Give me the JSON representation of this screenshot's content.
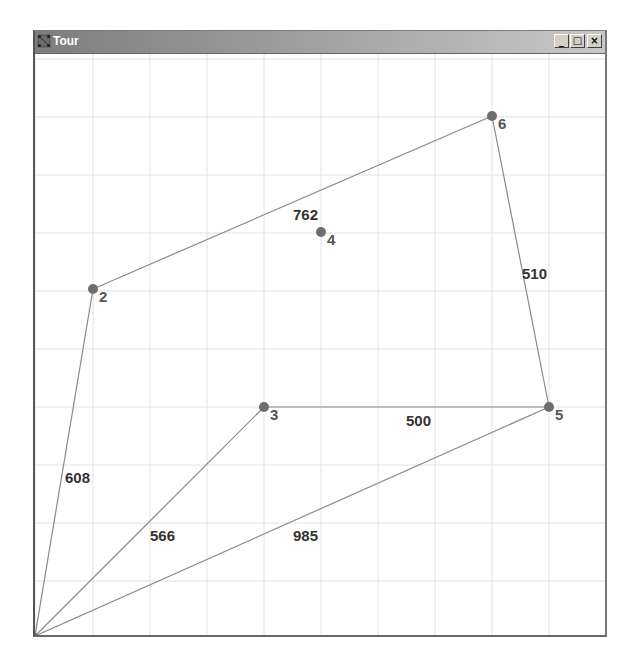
{
  "window": {
    "title": "Tour",
    "icon": "graph-app-icon",
    "controls": {
      "minimize": "_",
      "maximize": "□",
      "close": "×"
    }
  },
  "grid": {
    "columns_x": [
      35,
      93,
      150,
      207,
      264,
      321,
      378,
      435,
      492,
      549,
      606
    ],
    "rows_y": [
      58,
      116,
      174,
      232,
      290,
      348,
      406,
      464,
      522,
      580
    ],
    "color": "#e2e2e2"
  },
  "colors": {
    "node": "#6e6e6e",
    "edge": "#8a8a8a",
    "grid": "#e2e2e2",
    "label": "#555555"
  },
  "nodes": [
    {
      "id": "1",
      "label": "",
      "x": 35,
      "y": 635
    },
    {
      "id": "2",
      "label": "2",
      "x": 93,
      "y": 288
    },
    {
      "id": "3",
      "label": "3",
      "x": 264,
      "y": 406
    },
    {
      "id": "4",
      "label": "4",
      "x": 321,
      "y": 231
    },
    {
      "id": "5",
      "label": "5",
      "x": 549,
      "y": 406
    },
    {
      "id": "6",
      "label": "6",
      "x": 492,
      "y": 115
    }
  ],
  "edges": [
    {
      "from": "1",
      "to": "2",
      "weight": "608",
      "label_x": 65,
      "label_y": 482
    },
    {
      "from": "2",
      "to": "6",
      "weight": "762",
      "label_x": 293,
      "label_y": 219
    },
    {
      "from": "6",
      "to": "5",
      "weight": "510",
      "label_x": 522,
      "label_y": 278
    },
    {
      "from": "5",
      "to": "3",
      "weight": "500",
      "label_x": 406,
      "label_y": 425
    },
    {
      "from": "3",
      "to": "1",
      "weight": "566",
      "label_x": 150,
      "label_y": 540
    },
    {
      "from": "1",
      "to": "5",
      "weight": "985",
      "label_x": 293,
      "label_y": 540
    }
  ]
}
